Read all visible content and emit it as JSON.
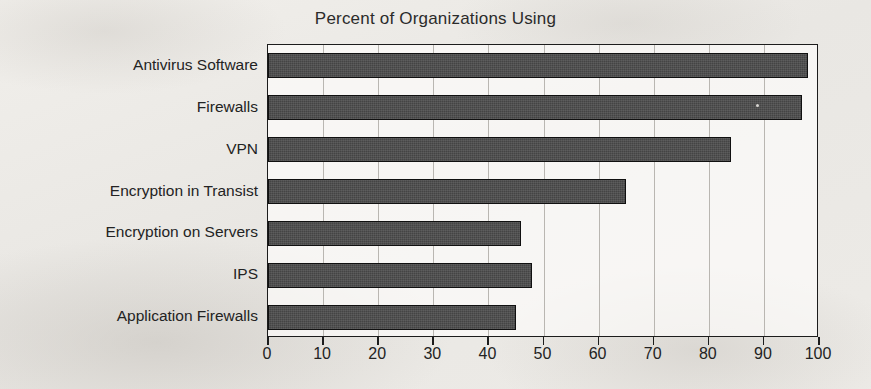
{
  "chart_data": {
    "type": "bar",
    "orientation": "horizontal",
    "title": "Percent of Organizations Using",
    "xlabel": "",
    "ylabel": "",
    "xlim": [
      0,
      100
    ],
    "xticks": [
      0,
      10,
      20,
      30,
      40,
      50,
      60,
      70,
      80,
      90,
      100
    ],
    "grid": true,
    "legend": false,
    "categories": [
      "Antivirus Software",
      "Firewalls",
      "VPN",
      "Encryption in Transist",
      "Encryption on Servers",
      "IPS",
      "Application Firewalls"
    ],
    "values": [
      98,
      97,
      84,
      65,
      46,
      48,
      45
    ],
    "bar_color": "#4b4b4b",
    "bar_edge_color": "#101010",
    "axis_color": "#1c1c1c",
    "gridline_color": "#b9b6b1",
    "background_color": "#eceae6"
  }
}
